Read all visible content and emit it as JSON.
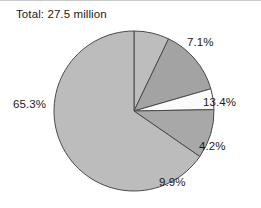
{
  "chart": {
    "title": "Total: 27.5 million",
    "stroke_color": "#4a4a4a",
    "background": "#ffffff"
  },
  "chart_data": {
    "type": "pie",
    "title": "Total: 27.5 million",
    "total_label": "Total: 27.5 million",
    "total_value": 27.5,
    "total_units": "million",
    "start_angle_deg": 0,
    "direction": "clockwise",
    "legend": "none",
    "grid": false,
    "labels": [
      "7.1%",
      "13.4%",
      "4.2%",
      "9.9%",
      "65.3%"
    ],
    "values": [
      7.1,
      13.4,
      4.2,
      9.9,
      65.3
    ],
    "colors": [
      "#bdbdbd",
      "#a3a3a3",
      "#fbfbfb",
      "#a8a8a8",
      "#bcbcbc"
    ],
    "slices": [
      {
        "label": "7.1%",
        "value": 7.1,
        "color": "#bdbdbd"
      },
      {
        "label": "13.4%",
        "value": 13.4,
        "color": "#a3a3a3"
      },
      {
        "label": "4.2%",
        "value": 4.2,
        "color": "#fbfbfb"
      },
      {
        "label": "9.9%",
        "value": 9.9,
        "color": "#a8a8a8"
      },
      {
        "label": "65.3%",
        "value": 65.3,
        "color": "#bcbcbc"
      }
    ],
    "xlabel": "",
    "ylabel": ""
  }
}
